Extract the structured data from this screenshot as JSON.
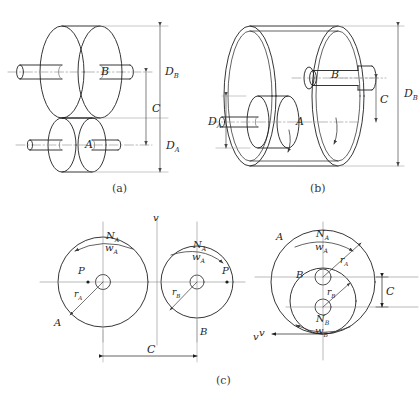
{
  "figure": {
    "panels": [
      {
        "id": "a",
        "caption": "(a)",
        "description": "Pictorial view: large disk B above small disk A, each on a shaft, external contact",
        "labels": {
          "disk_big": "B",
          "disk_small": "A",
          "dim_big_diameter": "D",
          "dim_big_diameter_sub": "B",
          "dim_center_distance": "C",
          "dim_small_diameter": "D",
          "dim_small_diameter_sub": "A"
        }
      },
      {
        "id": "b",
        "caption": "(b)",
        "description": "Pictorial view: small disk A running on the inside of ring B, internal contact",
        "labels": {
          "disk_big": "B",
          "disk_small": "A",
          "dim_big_diameter": "D",
          "dim_big_diameter_sub": "B",
          "dim_center_distance": "C",
          "dim_small_diameter": "D",
          "dim_small_diameter_sub": "A"
        }
      },
      {
        "id": "c",
        "caption": "(c)",
        "description": "Schematic end views: external contact (left) and internal contact (right)",
        "left": {
          "circle_a_label": "A",
          "circle_b_label": "B",
          "speed_a": "N",
          "speed_a_sub": "A",
          "omega_a": "w",
          "omega_a_sub": "A",
          "speed_b": "N",
          "speed_b_sub": "A",
          "omega_b": "w",
          "omega_b_sub": "A",
          "contact_point_left": "P",
          "contact_point_right": "P",
          "radius_a": "r",
          "radius_a_sub": "A",
          "radius_b": "r",
          "radius_b_sub": "B",
          "velocity_left": "v",
          "velocity_right": "v",
          "dim_center_distance": "C"
        },
        "right": {
          "circle_a_label": "A",
          "circle_b_label": "B",
          "speed_a": "N",
          "speed_a_sub": "A",
          "omega_a": "w",
          "omega_a_sub": "A",
          "speed_b": "N",
          "speed_b_sub": "B",
          "omega_b": "w",
          "omega_b_sub": "B",
          "radius_a": "r",
          "radius_a_sub": "A",
          "radius_b": "r",
          "radius_b_sub": "B",
          "velocity": "v",
          "dim_center_distance": "C"
        }
      }
    ]
  },
  "style": {
    "line_color": "#1f1f1f",
    "thin_line_color": "#6f6f6f",
    "center_line_color": "#8a8a8a",
    "background": "#ffffff"
  }
}
